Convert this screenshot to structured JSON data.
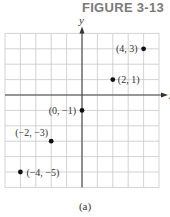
{
  "figure": {
    "title": "FIGURE 3-13",
    "caption": "(a)"
  },
  "chart_data": {
    "type": "scatter",
    "title": "FIGURE 3-13",
    "xlabel": "x",
    "ylabel": "y",
    "xlim": [
      -5,
      5
    ],
    "ylim": [
      -6,
      4
    ],
    "grid": true,
    "points": [
      {
        "x": 4,
        "y": 3,
        "label": "(4, 3)"
      },
      {
        "x": 2,
        "y": 1,
        "label": "(2, 1)"
      },
      {
        "x": 0,
        "y": -1,
        "label": "(0, −1)"
      },
      {
        "x": -2,
        "y": -3,
        "label": "(−2, −3)"
      },
      {
        "x": -4,
        "y": -5,
        "label": "(−4, −5)"
      }
    ],
    "caption": "(a)"
  }
}
